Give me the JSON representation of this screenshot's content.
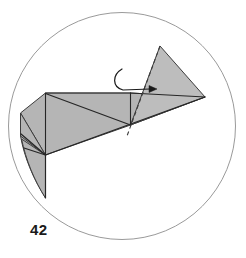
{
  "figure": {
    "kind": "origami-step-diagram",
    "step_label": "42",
    "background_color": "#ffffff"
  },
  "circle_frame": {
    "name": "frame-circle",
    "cx": 122,
    "cy": 126,
    "r": 113.5,
    "stroke_color": "#9a9a9a",
    "stroke_width": 1,
    "fill": "none"
  },
  "palette": {
    "paper_fill": "#b5b5b5",
    "paper_fill_light": "#bdbdbd",
    "edge_stroke": "#3c3c3c",
    "edge_stroke_dark": "#262626",
    "dashed_stroke": "#3c3c3c",
    "arrow_stroke": "#1a1a1a",
    "label_color": "#1a1a1a"
  },
  "shapes": [
    {
      "name": "lower-left-flap",
      "type": "path",
      "d": "M 21.5 141 L 46 139 L 46 198 L 46 198 Q 31 176 21.5 141 Z",
      "fill": "#b5b5b5",
      "stroke": "#3c3c3c",
      "stroke_width": 1
    },
    {
      "name": "left-body-panel",
      "type": "polygon",
      "points": "21.5 111, 46 93, 131 93, 131 125, 46 155",
      "fill": "#b5b5b5",
      "stroke": "#3c3c3c",
      "stroke_width": 1
    },
    {
      "name": "lower-tail-panel",
      "type": "path",
      "d": "M 46 155 L 46 198 L 46 198 Q 30 172 21.5 134 Z",
      "fill": "#b5b5b5",
      "stroke": "#3c3c3c",
      "stroke_width": 1
    },
    {
      "name": "lower-right-long-panel",
      "type": "polygon",
      "points": "46 155, 131 125, 205 97, 131 125",
      "fill": "#b5b5b5",
      "stroke": "#3c3c3c",
      "stroke_width": 1
    },
    {
      "name": "upper-right-triangle-flap",
      "type": "polygon",
      "points": "160 46, 205 97, 131 125",
      "fill": "#b5b5b5",
      "stroke": "#3c3c3c",
      "stroke_width": 1
    },
    {
      "name": "right-wing-panel",
      "type": "polygon",
      "points": "131 93, 205 97, 131 125",
      "fill": "#b5b5b5",
      "stroke": "#3c3c3c",
      "stroke_width": 1
    }
  ],
  "lines": [
    {
      "name": "top-edge-line",
      "x1": 46,
      "y1": 93,
      "x2": 131,
      "y2": 93,
      "stroke": "#3c3c3c"
    },
    {
      "name": "vertical-center-line",
      "x1": 46,
      "y1": 93,
      "x2": 46,
      "y2": 155,
      "stroke": "#262626"
    },
    {
      "name": "diagonal-body-line",
      "x1": 46,
      "y1": 93,
      "x2": 131,
      "y2": 125,
      "stroke": "#262626"
    },
    {
      "name": "right-panel-edge-line",
      "x1": 131,
      "y1": 93,
      "x2": 205,
      "y2": 97,
      "stroke": "#262626"
    },
    {
      "name": "long-bottom-edge-line",
      "x1": 46,
      "y1": 155,
      "x2": 205,
      "y2": 97,
      "stroke": "#262626"
    },
    {
      "name": "lower-flap-crease-line",
      "x1": 22,
      "y1": 135,
      "x2": 46,
      "y2": 155,
      "stroke": "#262626"
    },
    {
      "name": "lower-flap-crease-line-2",
      "x1": 24,
      "y1": 148,
      "x2": 46,
      "y2": 155,
      "stroke": "#262626"
    },
    {
      "name": "bottom-tail-vertical-line",
      "x1": 46,
      "y1": 155,
      "x2": 46,
      "y2": 198,
      "stroke": "#262626"
    }
  ],
  "fold_line": {
    "name": "dashed-fold-line",
    "x1": 160,
    "y1": 46,
    "x2": 128,
    "y2": 135,
    "stroke": "#3c3c3c",
    "dash_pattern": "4 3",
    "stroke_width": 1
  },
  "arrow": {
    "name": "fold-direction-arrow",
    "path": "M 121 70 C 113 76, 113 86, 122 90 L 152 89",
    "head_points": "152 86, 158 89, 152 92",
    "stroke": "#1a1a1a",
    "stroke_width": 1.2
  }
}
